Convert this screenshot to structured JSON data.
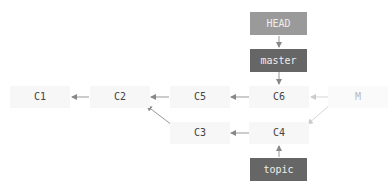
{
  "refs": {
    "head": {
      "label": "HEAD",
      "color": "#9a9a9a"
    },
    "master": {
      "label": "master",
      "color": "#666666"
    },
    "topic": {
      "label": "topic",
      "color": "#666666"
    }
  },
  "commits": {
    "c1": "C1",
    "c2": "C2",
    "c5": "C5",
    "c6": "C6",
    "m": "M",
    "c3": "C3",
    "c4": "C4"
  },
  "edges": [
    {
      "from": "C2",
      "to": "C1"
    },
    {
      "from": "C5",
      "to": "C2"
    },
    {
      "from": "C6",
      "to": "C5"
    },
    {
      "from": "M",
      "to": "C6",
      "style": "faded"
    },
    {
      "from": "M",
      "to": "C4",
      "style": "faded"
    },
    {
      "from": "C3",
      "to": "C2"
    },
    {
      "from": "C4",
      "to": "C3"
    },
    {
      "from": "HEAD",
      "to": "master"
    },
    {
      "from": "master",
      "to": "C6"
    },
    {
      "from": "topic",
      "to": "C4"
    }
  ]
}
